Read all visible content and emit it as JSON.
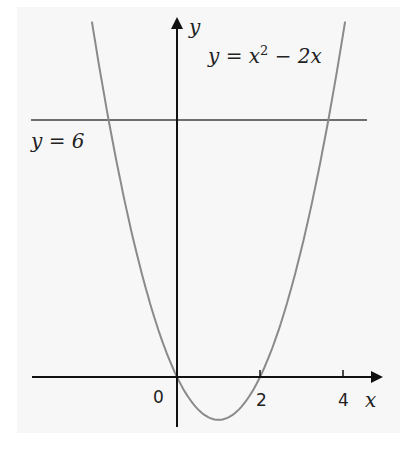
{
  "chart_data": {
    "type": "line",
    "title": "",
    "xlabel": "x",
    "ylabel": "y",
    "x_ticks": [
      "0",
      "2",
      "4"
    ],
    "xlim": [
      -3.4,
      5
    ],
    "ylim": [
      -1.5,
      8.3
    ],
    "grid": false,
    "series": [
      {
        "name": "y = x² − 2x",
        "equation": "y = x^2 - 2x",
        "x": [
          -2.2,
          -1.65,
          -1,
          0,
          1,
          2,
          3,
          3.65,
          4.2
        ],
        "values": [
          9.24,
          6,
          3,
          0,
          -1,
          0,
          3,
          6,
          9.24
        ]
      },
      {
        "name": "y = 6",
        "equation": "y = 6",
        "x": [
          -3.4,
          4.7
        ],
        "values": [
          6,
          6
        ]
      }
    ],
    "annotations": [
      "y = x² − 2x",
      "y = 6",
      "0"
    ],
    "intersections": [
      [
        -1.65,
        6
      ],
      [
        3.65,
        6
      ]
    ]
  },
  "labels": {
    "y_axis": "y",
    "x_axis": "x",
    "origin": "0",
    "tick_2": "2",
    "tick_4": "4",
    "curve_label_prefix": "y = x",
    "curve_label_exp": "2",
    "curve_label_suffix": " − 2x",
    "line_label": "y = 6"
  },
  "colors": {
    "curve": "#8a8a8a",
    "line": "#6e6e6e",
    "axis": "#111111",
    "panel": "#f7f7f7"
  }
}
